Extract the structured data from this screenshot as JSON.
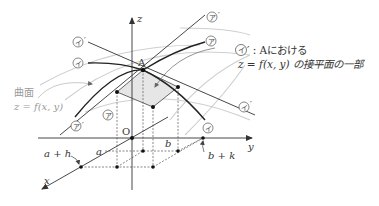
{
  "diagram": {
    "title": "",
    "axes": {
      "z_label": "z",
      "y_label": "y",
      "x_label": "x",
      "origin_label": "O"
    },
    "points": {
      "A_label": "A",
      "a_label": "a",
      "a_plus_h_label": "a + h",
      "b_label": "b",
      "b_plus_k_label": "b + k"
    },
    "surface": {
      "label_line1": "曲面",
      "label_line2": "z = f(x, y)"
    },
    "curves": {
      "a_mark": "ア",
      "a_prime_mark": "ア",
      "a_prime_suffix": "′",
      "i_mark": "イ",
      "i_prime_mark": "イ",
      "i_prime_suffix": "′"
    },
    "tangent_plane_annotation": {
      "mark": "イ",
      "line1_rest": "′ : Aにおける",
      "line2": "z = f(x, y) の接平面の一部"
    },
    "colors": {
      "ink": "#333333",
      "curve_gray": "#c8c8c8",
      "plane_fill": "#e6e6e6",
      "label_gray": "#9a9a9a"
    }
  }
}
